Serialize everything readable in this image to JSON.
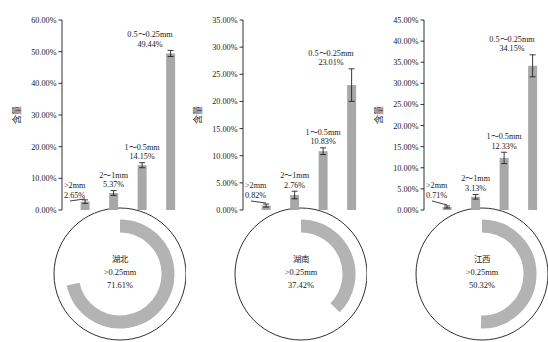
{
  "figure": {
    "y_axis_title": "含量",
    "panels": [
      {
        "region": "湖北",
        "donut_size_label": ">0.25mm",
        "donut_value_label": "71.61%",
        "donut_value": 71.61,
        "y_ticks": [
          "0.00%",
          "10.00%",
          "20.00%",
          "30.00%",
          "40.00%",
          "50.00%",
          "60.00%"
        ],
        "y_max": 60,
        "bars": [
          {
            "size": ">2mm",
            "value_label": "2.65%",
            "value": 2.65,
            "err": 0.55
          },
          {
            "size": "2～1mm",
            "value_label": "5.37%",
            "value": 5.37,
            "err": 0.75
          },
          {
            "size": "1～0.5mm",
            "value_label": "14.15%",
            "value": 14.15,
            "err": 0.8
          },
          {
            "size": "0.5～0.25mm",
            "value_label": "49.44%",
            "value": 49.44,
            "err": 0.95
          }
        ]
      },
      {
        "region": "湖南",
        "donut_size_label": ">0.25mm",
        "donut_value_label": "37.42%",
        "donut_value": 37.42,
        "y_ticks": [
          "0.00%",
          "5.00%",
          "10.00%",
          "15.00%",
          "20.00%",
          "25.00%",
          "30.00%",
          "35.00%"
        ],
        "y_max": 35,
        "bars": [
          {
            "size": ">2mm",
            "value_label": "0.82%",
            "value": 0.82,
            "err": 0.28
          },
          {
            "size": "2～1mm",
            "value_label": "2.76%",
            "value": 2.76,
            "err": 0.7
          },
          {
            "size": "1～0.5mm",
            "value_label": "10.83%",
            "value": 10.83,
            "err": 0.62
          },
          {
            "size": "0.5～0.25mm",
            "value_label": "23.01%",
            "value": 23.01,
            "err": 3.0
          }
        ]
      },
      {
        "region": "江西",
        "donut_size_label": ">0.25mm",
        "donut_value_label": "50.32%",
        "donut_value": 50.32,
        "y_ticks": [
          "0.00%",
          "5.00%",
          "10.00%",
          "15.00%",
          "20.00%",
          "25.00%",
          "30.00%",
          "35.00%",
          "40.00%",
          "45.00%"
        ],
        "y_max": 45,
        "bars": [
          {
            "size": ">2mm",
            "value_label": "0.71%",
            "value": 0.71,
            "err": 0.25
          },
          {
            "size": "2～1mm",
            "value_label": "3.13%",
            "value": 3.13,
            "err": 0.55
          },
          {
            "size": "1～0.5mm",
            "value_label": "12.33%",
            "value": 12.33,
            "err": 1.35
          },
          {
            "size": "0.5～0.25mm",
            "value_label": "34.15%",
            "value": 34.15,
            "err": 2.6
          }
        ]
      }
    ]
  },
  "chart_data": {
    "type": "bar",
    "title": "",
    "xlabel": "",
    "ylabel": "含量",
    "grid": false,
    "legend": "none",
    "categories": [
      ">2mm",
      "2～1mm",
      "1～0.5mm",
      "0.5～0.25mm"
    ],
    "panels": [
      {
        "name": "湖北",
        "ylim": [
          0,
          60
        ],
        "yticks": [
          0,
          10,
          20,
          30,
          40,
          50,
          60
        ],
        "values": [
          2.65,
          5.37,
          14.15,
          49.44
        ],
        "errors": [
          0.55,
          0.75,
          0.8,
          0.95
        ],
        "donut": {
          "label": ">0.25mm",
          "value": 71.61
        }
      },
      {
        "name": "湖南",
        "ylim": [
          0,
          35
        ],
        "yticks": [
          0,
          5,
          10,
          15,
          20,
          25,
          30,
          35
        ],
        "values": [
          0.82,
          2.76,
          10.83,
          23.01
        ],
        "errors": [
          0.28,
          0.7,
          0.62,
          3.0
        ],
        "donut": {
          "label": ">0.25mm",
          "value": 37.42
        }
      },
      {
        "name": "江西",
        "ylim": [
          0,
          45
        ],
        "yticks": [
          0,
          5,
          10,
          15,
          20,
          25,
          30,
          35,
          40,
          45
        ],
        "values": [
          0.71,
          3.13,
          12.33,
          34.15
        ],
        "errors": [
          0.25,
          0.55,
          1.35,
          2.6
        ],
        "donut": {
          "label": ">0.25mm",
          "value": 50.32
        }
      }
    ]
  }
}
